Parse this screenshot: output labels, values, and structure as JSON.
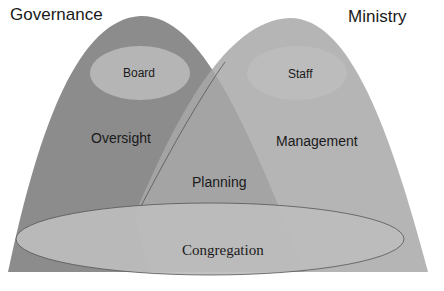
{
  "diagram": {
    "titles": {
      "left": "Governance",
      "right": "Ministry"
    },
    "regions": {
      "left": "Oversight",
      "right": "Management",
      "overlap": "Planning",
      "base": "Congregation"
    },
    "inner_ovals": {
      "left": "Board",
      "right": "Staff"
    },
    "colors": {
      "left_shape": "#8c8c8c",
      "right_shape": "#a6a6a6",
      "overlap": "#999999",
      "inner_oval": "#b4b4b4",
      "base_oval": "#b8b8b8",
      "outline": "#555555"
    }
  }
}
